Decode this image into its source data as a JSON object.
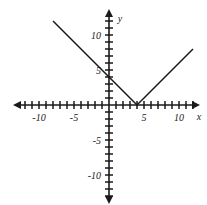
{
  "chart_data": {
    "type": "line",
    "title": "",
    "subtitle": "",
    "xlabel": "x",
    "ylabel": "y",
    "grid": false,
    "legend": null,
    "xlim": [
      -13,
      14
    ],
    "ylim": [
      -14,
      14
    ],
    "x_tick_interval": 1,
    "y_tick_interval": 1,
    "x_labeled_ticks": [
      {
        "value": -10,
        "label": "-10"
      },
      {
        "value": -5,
        "label": "-5"
      },
      {
        "value": 5,
        "label": "5"
      },
      {
        "value": 10,
        "label": "10"
      }
    ],
    "y_labeled_ticks": [
      {
        "value": 10,
        "label": "10"
      },
      {
        "value": 5,
        "label": "5"
      },
      {
        "value": -5,
        "label": "-5"
      },
      {
        "value": -10,
        "label": "-10"
      }
    ],
    "x_tick_values": [
      -13,
      -12,
      -11,
      -10,
      -9,
      -8,
      -7,
      -6,
      -5,
      -4,
      -3,
      -2,
      -1,
      1,
      2,
      3,
      4,
      5,
      6,
      7,
      8,
      9,
      10,
      11,
      12,
      13
    ],
    "y_tick_values": [
      -13,
      -12,
      -11,
      -10,
      -9,
      -8,
      -7,
      -6,
      -5,
      -4,
      -3,
      -2,
      -1,
      1,
      2,
      3,
      4,
      5,
      6,
      7,
      8,
      9,
      10,
      11,
      12,
      13
    ],
    "axes_have_arrowheads": true,
    "series": [
      {
        "name": "y = |x - 4|",
        "shape": "v-shaped absolute value graph",
        "vertex": [
          4,
          0
        ],
        "y_intercept": 4,
        "x_intercept": 4,
        "left_branch_slope": -1,
        "right_branch_slope": 1,
        "points": [
          [
            -8,
            12
          ],
          [
            4,
            0
          ],
          [
            12,
            8
          ]
        ],
        "color": "#1a1a1a"
      }
    ]
  },
  "axis_labels": {
    "x": "x",
    "y": "y"
  },
  "colors": {
    "ink": "#1a1a1a",
    "background": "#ffffff"
  }
}
